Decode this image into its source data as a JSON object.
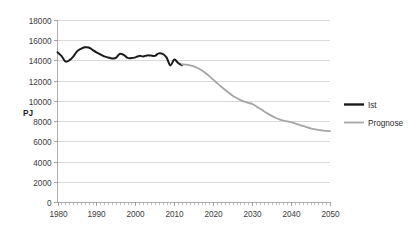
{
  "chart_data": {
    "type": "line",
    "title": "",
    "xlabel": "",
    "ylabel": "PJ",
    "xlim": [
      1980,
      2050
    ],
    "ylim": [
      0,
      18000
    ],
    "grid": true,
    "legend_position": "right",
    "y_ticks": [
      0,
      2000,
      4000,
      6000,
      8000,
      10000,
      12000,
      14000,
      16000,
      18000
    ],
    "y_tick_labels": [
      "0",
      "2000",
      "4000",
      "6000",
      "8000",
      "10000",
      "12000",
      "14000",
      "16000",
      "18000"
    ],
    "x_ticks": [
      1980,
      1990,
      2000,
      2010,
      2020,
      2030,
      2040,
      2050
    ],
    "x_tick_labels": [
      "1980",
      "1990",
      "2000",
      "2010",
      "2020",
      "2030",
      "2040",
      "2050"
    ],
    "x_minor_tick_step": 1,
    "series": [
      {
        "name": "Ist",
        "color": "#1a1a1a",
        "x": [
          1980,
          1981,
          1982,
          1983,
          1984,
          1985,
          1986,
          1987,
          1988,
          1989,
          1990,
          1991,
          1992,
          1993,
          1994,
          1995,
          1996,
          1997,
          1998,
          1999,
          2000,
          2001,
          2002,
          2003,
          2004,
          2005,
          2006,
          2007,
          2008,
          2009,
          2010,
          2011,
          2012
        ],
        "values": [
          14800,
          14450,
          13900,
          14000,
          14350,
          14900,
          15150,
          15300,
          15280,
          15050,
          14800,
          14600,
          14400,
          14300,
          14200,
          14250,
          14650,
          14550,
          14250,
          14230,
          14300,
          14450,
          14400,
          14500,
          14480,
          14450,
          14700,
          14650,
          14300,
          13500,
          14100,
          13750,
          13520
        ]
      },
      {
        "name": "Prognose",
        "color": "#a6a6a6",
        "x": [
          2012,
          2013,
          2014,
          2015,
          2016,
          2017,
          2018,
          2019,
          2020,
          2021,
          2022,
          2023,
          2024,
          2025,
          2026,
          2027,
          2028,
          2029,
          2030,
          2031,
          2032,
          2033,
          2034,
          2035,
          2036,
          2037,
          2038,
          2039,
          2040,
          2041,
          2042,
          2043,
          2044,
          2045,
          2046,
          2047,
          2048,
          2049,
          2050
        ],
        "values": [
          13600,
          13580,
          13520,
          13420,
          13250,
          13030,
          12760,
          12450,
          12100,
          11760,
          11420,
          11100,
          10800,
          10520,
          10280,
          10080,
          9920,
          9800,
          9700,
          9480,
          9230,
          8980,
          8740,
          8520,
          8330,
          8180,
          8060,
          7980,
          7900,
          7780,
          7650,
          7520,
          7400,
          7290,
          7200,
          7130,
          7080,
          7030,
          7000
        ]
      }
    ],
    "legend": [
      {
        "label": "Ist",
        "color": "#1a1a1a",
        "style": "thick-solid"
      },
      {
        "label": "Prognose",
        "color": "#a6a6a6",
        "style": "thin-solid"
      }
    ]
  },
  "colors": {
    "background": "#ffffff",
    "gridline": "#c9c9c9",
    "axis": "#9a9a9a",
    "ist": "#1a1a1a",
    "prognose": "#a6a6a6",
    "text": "#3a3a3a"
  }
}
